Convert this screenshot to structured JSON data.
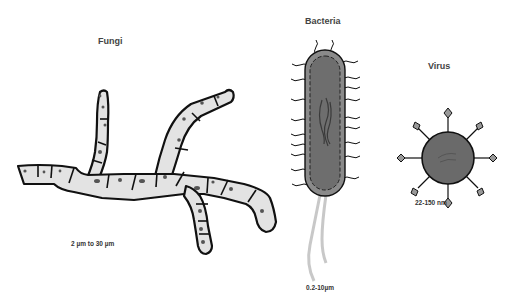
{
  "diagram": {
    "organisms": [
      {
        "id": "fungi",
        "title": "Fungi",
        "size_range": "2 µm to 30 µm"
      },
      {
        "id": "bacteria",
        "title": "Bacteria",
        "size_range": "0.2-10µm"
      },
      {
        "id": "virus",
        "title": "Virus",
        "size_range": "22-150 nm"
      }
    ],
    "colors": {
      "outline": "#111111",
      "fungi_fill": "#e3e3e3",
      "nucleus": "#555555",
      "bacteria_fill": "#6e6e6e",
      "bacteria_capsule": "#8a8a8a",
      "flagella": "#c8c8c8",
      "virus_fill": "#6a6a6a"
    }
  }
}
